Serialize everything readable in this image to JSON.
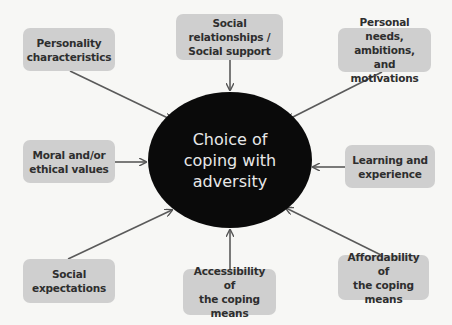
{
  "diagram": {
    "type": "hub-and-spoke",
    "center": {
      "label": "Choice of\ncoping with\nadversity",
      "fill": "#0a0a0a",
      "text_color": "#e8e8e8"
    },
    "box_fill": "#cfcfcf",
    "arrow_color": "#555555",
    "nodes": [
      {
        "id": "personality",
        "label": "Personality\ncharacteristics"
      },
      {
        "id": "social-relationships",
        "label": "Social\nrelationships /\nSocial support"
      },
      {
        "id": "personal-needs",
        "label": "Personal needs,\nambitions, and\nmotivations"
      },
      {
        "id": "moral-values",
        "label": "Moral and/or\nethical values"
      },
      {
        "id": "learning",
        "label": "Learning and\nexperience"
      },
      {
        "id": "social-expectations",
        "label": "Social\nexpectations"
      },
      {
        "id": "accessibility",
        "label": "Accessibility of\nthe coping\nmeans"
      },
      {
        "id": "affordability",
        "label": "Affordability of\nthe coping\nmeans"
      }
    ],
    "edges": [
      {
        "from": "personality",
        "to": "center"
      },
      {
        "from": "social-relationships",
        "to": "center"
      },
      {
        "from": "personal-needs",
        "to": "center"
      },
      {
        "from": "moral-values",
        "to": "center"
      },
      {
        "from": "learning",
        "to": "center"
      },
      {
        "from": "social-expectations",
        "to": "center"
      },
      {
        "from": "accessibility",
        "to": "center"
      },
      {
        "from": "affordability",
        "to": "center"
      }
    ]
  }
}
